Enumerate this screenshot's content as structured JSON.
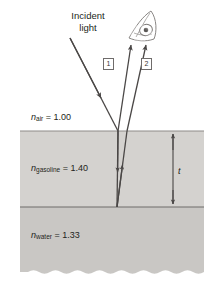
{
  "figure": {
    "incident_label_line1": "Incident",
    "incident_label_line2": "light",
    "thickness_label": "t",
    "observer_icon": "eye-icon"
  },
  "media": [
    {
      "id": "air",
      "symbol": "n",
      "subscript": "air",
      "equals": " = ",
      "value": "1.00",
      "color": "#ffffff"
    },
    {
      "id": "gasoline",
      "symbol": "n",
      "subscript": "gasoline",
      "equals": " = ",
      "value": "1.40",
      "color": "#d4d2cf"
    },
    {
      "id": "water",
      "symbol": "n",
      "subscript": "water",
      "equals": " = ",
      "value": "1.33",
      "color": "#c9c7c4"
    }
  ],
  "rays": [
    {
      "id": "incident",
      "label": "",
      "direction": "down-right"
    },
    {
      "id": "reflected-1",
      "label": "1",
      "direction": "up-right"
    },
    {
      "id": "reflected-2",
      "label": "2",
      "direction": "up-right"
    }
  ],
  "colors": {
    "ink": "#231f20",
    "ray": "#4a4746",
    "boundary": "#6f6c6b",
    "air_fill": "#ffffff",
    "gasoline_fill": "#d4d2cf",
    "water_fill": "#c9c7c4",
    "tag_border": "#6f6c6b"
  }
}
